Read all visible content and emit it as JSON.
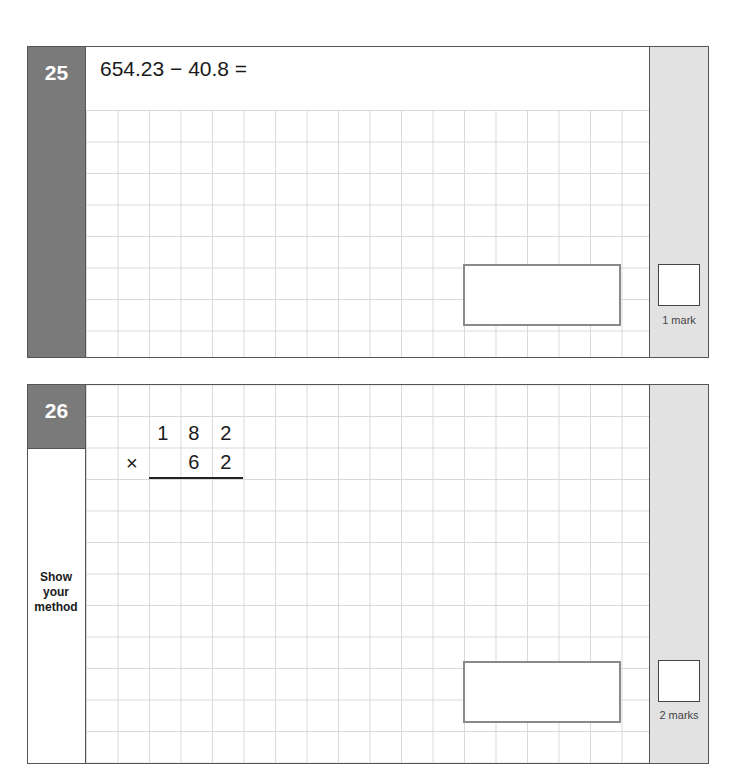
{
  "questions": [
    {
      "number": "25",
      "prompt": "654.23 − 40.8 =",
      "marks_label": "1 mark"
    },
    {
      "number": "26",
      "multiplication": {
        "top_digits": [
          "1",
          "8",
          "2"
        ],
        "operator": "×",
        "bottom_digits": [
          "6",
          "2"
        ]
      },
      "method_label": [
        "Show",
        "your",
        "method"
      ],
      "marks_label": "2 marks"
    }
  ],
  "colors": {
    "number_column": "#7a7a7a",
    "margin_column": "#e2e2e2",
    "grid_line": "#d9d9d9",
    "answer_box_border": "#8a8a8a"
  }
}
